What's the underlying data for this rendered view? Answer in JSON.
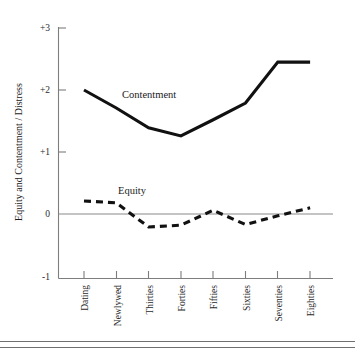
{
  "chart_data": {
    "type": "line",
    "title": "",
    "xlabel": "",
    "ylabel": "Equity and Contentment / Distress",
    "ylim": [
      -1,
      3
    ],
    "yticks": [
      "+3",
      "+2",
      "+1",
      "0",
      "-1"
    ],
    "ytick_values": [
      3,
      2,
      1,
      0,
      -1
    ],
    "grid": false,
    "zero_reference_line": true,
    "legend": "inline-labels",
    "categories": [
      "Dating",
      "Newlywed",
      "Thirties",
      "Forties",
      "Fifties",
      "Sixties",
      "Seventies",
      "Eighties"
    ],
    "series": [
      {
        "name": "Contentment",
        "style": "solid",
        "color": "#111111",
        "label_position": "above-line-between-newlywed-and-thirties",
        "values": [
          2.0,
          1.71,
          1.39,
          1.26,
          1.52,
          1.79,
          2.45,
          2.45
        ]
      },
      {
        "name": "Equity",
        "style": "dashed",
        "color": "#111111",
        "label_position": "above-line-near-newlywed",
        "values": [
          0.21,
          0.18,
          -0.21,
          -0.18,
          0.06,
          -0.17,
          -0.03,
          0.1
        ]
      }
    ]
  },
  "labels": {
    "series_contentment": "Contentment",
    "series_equity": "Equity",
    "y_axis_title": "Equity and Contentment / Distress"
  }
}
